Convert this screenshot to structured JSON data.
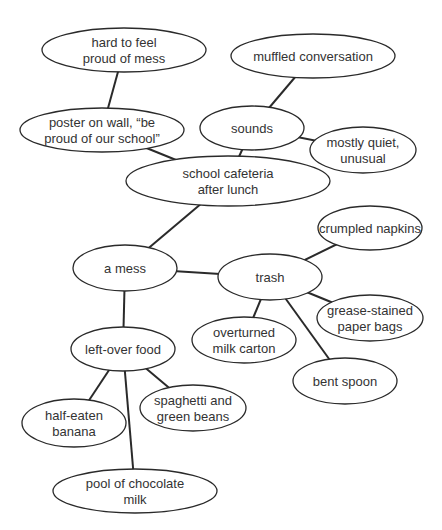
{
  "diagram": {
    "type": "cluster-map",
    "center_node": "cafeteria",
    "nodes": [
      {
        "id": "hard",
        "lines": [
          "hard to feel",
          "proud of mess"
        ]
      },
      {
        "id": "poster",
        "lines": [
          "poster on wall, “be",
          "proud of our school”"
        ]
      },
      {
        "id": "muffled",
        "lines": [
          "muffled conversation"
        ]
      },
      {
        "id": "sounds",
        "lines": [
          "sounds"
        ]
      },
      {
        "id": "quiet",
        "lines": [
          "mostly quiet,",
          "unusual"
        ]
      },
      {
        "id": "cafeteria",
        "lines": [
          "school cafeteria",
          "after lunch"
        ]
      },
      {
        "id": "mess",
        "lines": [
          "a mess"
        ]
      },
      {
        "id": "trash",
        "lines": [
          "trash"
        ]
      },
      {
        "id": "napkins",
        "lines": [
          "crumpled napkins"
        ]
      },
      {
        "id": "bags",
        "lines": [
          "grease-stained",
          "paper bags"
        ]
      },
      {
        "id": "carton",
        "lines": [
          "overturned",
          "milk carton"
        ]
      },
      {
        "id": "spoon",
        "lines": [
          "bent spoon"
        ]
      },
      {
        "id": "food",
        "lines": [
          "left-over food"
        ]
      },
      {
        "id": "spaghetti",
        "lines": [
          "spaghetti and",
          "green beans"
        ]
      },
      {
        "id": "banana",
        "lines": [
          "half-eaten",
          "banana"
        ]
      },
      {
        "id": "chocolate",
        "lines": [
          "pool of chocolate",
          "milk"
        ]
      }
    ],
    "edges": [
      [
        "hard",
        "poster"
      ],
      [
        "poster",
        "cafeteria"
      ],
      [
        "muffled",
        "sounds"
      ],
      [
        "sounds",
        "quiet"
      ],
      [
        "sounds",
        "cafeteria"
      ],
      [
        "cafeteria",
        "mess"
      ],
      [
        "mess",
        "trash"
      ],
      [
        "trash",
        "napkins"
      ],
      [
        "trash",
        "bags"
      ],
      [
        "trash",
        "carton"
      ],
      [
        "trash",
        "spoon"
      ],
      [
        "mess",
        "food"
      ],
      [
        "food",
        "spaghetti"
      ],
      [
        "food",
        "banana"
      ],
      [
        "food",
        "chocolate"
      ]
    ]
  }
}
